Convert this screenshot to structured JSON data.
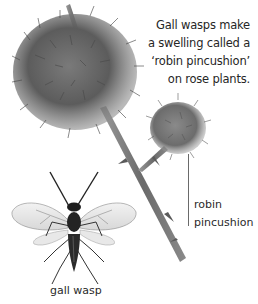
{
  "caption": {
    "lines": [
      "Gall wasps make",
      "a swelling called a",
      "‘robin pincushion’",
      "on rose plants."
    ]
  },
  "labels": {
    "robin_pincushion": [
      "robin",
      "pincushion"
    ],
    "gall_wasp": "gall wasp"
  },
  "illustration": {
    "subjects": [
      "large-robin-pincushion-gall",
      "small-robin-pincushion-gall",
      "rose-stem",
      "gall-wasp"
    ],
    "colors": {
      "gall": "#5a5a5a",
      "stem": "#7a7a7a",
      "wasp_body": "#1e1e1e",
      "wing": "#d9d9d9",
      "leader_line": "#6a6a6a"
    }
  }
}
